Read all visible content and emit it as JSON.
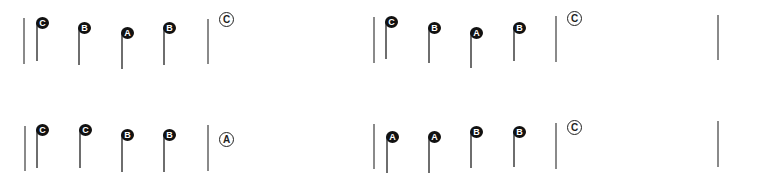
{
  "exercises": [
    {
      "id": "row1-left",
      "bars": [
        {
          "x": 23,
          "y": 18,
          "h": 46
        },
        {
          "x": 207,
          "y": 19,
          "h": 45
        }
      ],
      "notes": [
        {
          "label": "C",
          "x": 36,
          "y": 17,
          "stem": 38
        },
        {
          "label": "B",
          "x": 78,
          "y": 22,
          "stem": 37
        },
        {
          "label": "A",
          "x": 121,
          "y": 27,
          "stem": 36
        },
        {
          "label": "B",
          "x": 163,
          "y": 22,
          "stem": 37
        }
      ],
      "answer": {
        "label": "C",
        "x": 219,
        "y": 12
      }
    },
    {
      "id": "row1-right",
      "bars": [
        {
          "x": 373,
          "y": 17,
          "h": 46
        },
        {
          "x": 555,
          "y": 16,
          "h": 46
        },
        {
          "x": 717,
          "y": 15,
          "h": 45
        }
      ],
      "notes": [
        {
          "label": "C",
          "x": 385,
          "y": 16,
          "stem": 37
        },
        {
          "label": "B",
          "x": 428,
          "y": 22,
          "stem": 35
        },
        {
          "label": "A",
          "x": 470,
          "y": 27,
          "stem": 35
        },
        {
          "label": "B",
          "x": 513,
          "y": 22,
          "stem": 33
        }
      ],
      "answer": {
        "label": "C",
        "x": 567,
        "y": 11
      }
    },
    {
      "id": "row2-left",
      "bars": [
        {
          "x": 24,
          "y": 126,
          "h": 45
        },
        {
          "x": 207,
          "y": 125,
          "h": 46
        }
      ],
      "notes": [
        {
          "label": "C",
          "x": 36,
          "y": 124,
          "stem": 38
        },
        {
          "label": "C",
          "x": 79,
          "y": 124,
          "stem": 38
        },
        {
          "label": "B",
          "x": 121,
          "y": 129,
          "stem": 37
        },
        {
          "label": "B",
          "x": 163,
          "y": 129,
          "stem": 37
        }
      ],
      "answer": {
        "label": "A",
        "x": 219,
        "y": 132
      }
    },
    {
      "id": "row2-right",
      "bars": [
        {
          "x": 373,
          "y": 124,
          "h": 45
        },
        {
          "x": 555,
          "y": 123,
          "h": 46
        },
        {
          "x": 717,
          "y": 121,
          "h": 46
        }
      ],
      "notes": [
        {
          "label": "A",
          "x": 386,
          "y": 131,
          "stem": 36
        },
        {
          "label": "A",
          "x": 428,
          "y": 131,
          "stem": 36
        },
        {
          "label": "B",
          "x": 470,
          "y": 126,
          "stem": 36
        },
        {
          "label": "B",
          "x": 513,
          "y": 126,
          "stem": 35
        }
      ],
      "answer": {
        "label": "C",
        "x": 567,
        "y": 120
      }
    }
  ]
}
